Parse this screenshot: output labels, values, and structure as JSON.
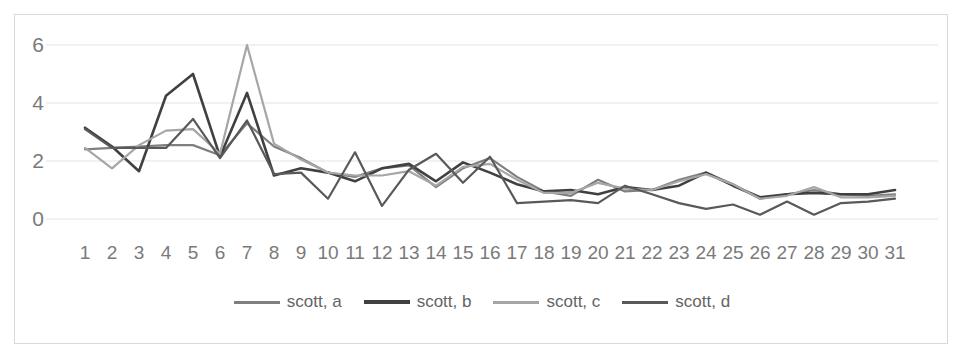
{
  "chart_data": {
    "type": "line",
    "title": "",
    "xlabel": "",
    "ylabel": "",
    "grid": true,
    "legend_position": "bottom",
    "xlim": [
      1,
      31
    ],
    "ylim": [
      0,
      6.4
    ],
    "yticks": [
      0,
      2,
      4,
      6
    ],
    "ytick_labels": [
      "0",
      "2",
      "4",
      "6"
    ],
    "x": [
      1,
      2,
      3,
      4,
      5,
      6,
      7,
      8,
      9,
      10,
      11,
      12,
      13,
      14,
      15,
      16,
      17,
      18,
      19,
      20,
      21,
      22,
      23,
      24,
      25,
      26,
      27,
      28,
      29,
      30,
      31
    ],
    "xtick_labels": [
      "1",
      "2",
      "3",
      "4",
      "5",
      "6",
      "7",
      "8",
      "9",
      "10",
      "11",
      "12",
      "13",
      "14",
      "15",
      "16",
      "17",
      "18",
      "19",
      "20",
      "21",
      "22",
      "23",
      "24",
      "25",
      "26",
      "27",
      "28",
      "29",
      "30",
      "31"
    ],
    "series": [
      {
        "name": "scott, a",
        "color": "#7f7f7f",
        "values": [
          2.4,
          2.45,
          2.5,
          2.55,
          2.55,
          2.2,
          3.3,
          2.5,
          2.1,
          1.6,
          1.45,
          1.75,
          1.85,
          1.1,
          1.75,
          2.1,
          1.45,
          0.95,
          0.8,
          1.35,
          0.95,
          1.0,
          1.35,
          1.6,
          1.2,
          0.7,
          0.85,
          1.0,
          0.85,
          0.8,
          0.85
        ]
      },
      {
        "name": "scott, b",
        "color": "#404040",
        "values": [
          3.15,
          2.5,
          1.65,
          4.25,
          5.0,
          2.15,
          4.35,
          1.5,
          1.75,
          1.6,
          1.3,
          1.75,
          1.9,
          1.3,
          1.95,
          1.6,
          1.2,
          0.95,
          1.0,
          0.85,
          1.1,
          1.0,
          1.15,
          1.6,
          1.15,
          0.75,
          0.85,
          0.9,
          0.85,
          0.85,
          1.0
        ]
      },
      {
        "name": "scott, c",
        "color": "#a6a6a6",
        "values": [
          2.45,
          1.75,
          2.55,
          3.05,
          3.1,
          2.25,
          6.0,
          2.6,
          2.05,
          1.6,
          1.5,
          1.5,
          1.65,
          1.15,
          1.8,
          1.9,
          1.35,
          0.9,
          0.9,
          1.25,
          1.05,
          1.0,
          1.3,
          1.55,
          1.2,
          0.7,
          0.8,
          1.1,
          0.75,
          0.75,
          0.8
        ]
      },
      {
        "name": "scott, d",
        "color": "#595959",
        "values": [
          3.1,
          2.45,
          2.45,
          2.45,
          3.45,
          2.1,
          3.4,
          1.55,
          1.6,
          0.7,
          2.3,
          0.45,
          1.7,
          2.25,
          1.25,
          2.15,
          0.55,
          0.6,
          0.65,
          0.55,
          1.15,
          0.85,
          0.55,
          0.35,
          0.5,
          0.15,
          0.6,
          0.15,
          0.55,
          0.6,
          0.7
        ]
      }
    ]
  },
  "legend": {
    "items": [
      {
        "label": "scott, a"
      },
      {
        "label": "scott, b"
      },
      {
        "label": "scott, c"
      },
      {
        "label": "scott, d"
      }
    ]
  }
}
